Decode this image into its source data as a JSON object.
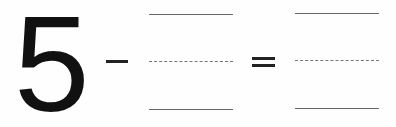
{
  "equation": {
    "minuend": "5",
    "operator": "-",
    "equals": "=",
    "blanks": [
      {
        "id": "subtrahend",
        "value": ""
      },
      {
        "id": "difference",
        "value": ""
      }
    ]
  },
  "colors": {
    "ink": "#111111",
    "guide_lines": "#666666",
    "background": "#fefefe"
  }
}
